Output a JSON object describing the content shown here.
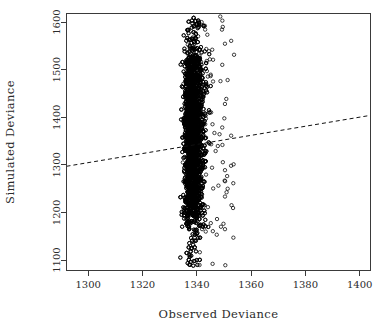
{
  "chart_data": {
    "type": "scatter",
    "title": "",
    "xlabel": "Observed Deviance",
    "ylabel": "Simulated Deviance",
    "xlim": [
      1292,
      1404
    ],
    "ylim": [
      1078,
      1618
    ],
    "xticks": [
      1300,
      1320,
      1340,
      1360,
      1380,
      1400
    ],
    "yticks": [
      1100,
      1200,
      1300,
      1400,
      1500,
      1600
    ],
    "xtick_labels": [
      "1300",
      "1320",
      "1340",
      "1360",
      "1380",
      "1400"
    ],
    "ytick_labels": [
      "1100",
      "1200",
      "1300",
      "1400",
      "1500",
      "1600"
    ],
    "grid": false,
    "legend": null,
    "marker": "open-circle",
    "marker_size_px": 3.4,
    "point_color": "#000000",
    "background_color": "#ffffff",
    "axis_color": "#3a3a3a",
    "box_frame": true,
    "reference_line": {
      "style": "dashed",
      "color": "#111111",
      "x_start": 1292,
      "y_start": 1297,
      "x_end": 1404,
      "y_end": 1404,
      "description": "dashed regression reference line with small positive slope"
    },
    "cloud_summary": {
      "n_points_approx": 4000,
      "x_core_range": [
        1335,
        1343
      ],
      "x_full_range": [
        1333,
        1354
      ],
      "y_core_range": [
        1180,
        1540
      ],
      "y_full_range": [
        1085,
        1612
      ],
      "x_mode": 1338,
      "y_median": 1360,
      "note": "Simulated deviances span a wide vertical band over a very narrow observed-deviance range; a right-hand tail of sparse open circles extends to about 1354 with low-density outliers near 1100 and above 1590."
    },
    "series": [
      {
        "name": "simulated vs observed deviance",
        "x": [
          1338.1,
          1337.4,
          1339.0,
          1336.8,
          1340.2,
          1338.7,
          1337.0,
          1341.3,
          1339.6,
          1336.2
        ],
        "y": [
          1402,
          1315,
          1478,
          1248,
          1540,
          1370,
          1205,
          1455,
          1290,
          1520
        ]
      }
    ]
  },
  "axes": {
    "x_title": "Observed Deviance",
    "y_title": "Simulated Deviance"
  }
}
